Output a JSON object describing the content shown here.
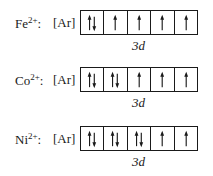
{
  "rows": [
    {
      "ion": "Fe",
      "charge": "2+",
      "core": "[Ar]",
      "subshell": "3d",
      "orbitals": [
        "pair",
        "up",
        "up",
        "up",
        "up"
      ]
    },
    {
      "ion": "Co",
      "charge": "2+",
      "core": "[Ar]",
      "subshell": "3d",
      "orbitals": [
        "pair",
        "pair",
        "up",
        "up",
        "up"
      ]
    },
    {
      "ion": "Ni",
      "charge": "2+",
      "core": "[Ar]",
      "subshell": "3d",
      "orbitals": [
        "pair",
        "pair",
        "pair",
        "up",
        "up"
      ]
    }
  ],
  "separator": ":"
}
